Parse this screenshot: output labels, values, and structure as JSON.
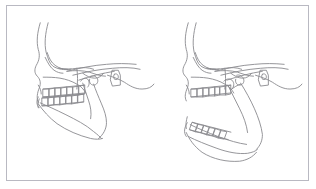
{
  "figure": {
    "background_color": "#ffffff",
    "border_color": "#b9b9c2",
    "line_color": "#8a8a8f",
    "panel_count": 2
  },
  "panels": [
    {
      "id": "left",
      "name": "mandible-closed-tracing",
      "caption": "",
      "description": "Lateral skull tracing with mandible closed, upper and lower teeth in occlusion",
      "mandible_state": "closed",
      "occlusion": "teeth in contact",
      "structures": [
        "frontal bone profile",
        "nasal bone",
        "orbit",
        "maxilla",
        "upper dental arch",
        "lower dental arch",
        "mandibular body",
        "mandibular ramus",
        "condyle",
        "cranial base",
        "cervical vertebra",
        "soft tissue profile"
      ],
      "upper_teeth_count": 7,
      "lower_teeth_count": 7
    },
    {
      "id": "right",
      "name": "mandible-open-tracing",
      "caption": "",
      "description": "Lateral skull tracing with mandible rotated open, showing interocclusal space",
      "mandible_state": "open",
      "occlusion": "open bite, mandible rotated downward and backward",
      "structures": [
        "frontal bone profile",
        "nasal bone",
        "orbit",
        "maxilla",
        "upper dental arch",
        "lower dental arch",
        "mandibular body",
        "mandibular ramus",
        "condyle",
        "cranial base",
        "cervical vertebra",
        "soft tissue profile"
      ],
      "upper_teeth_count": 7,
      "lower_teeth_count": 6
    }
  ]
}
